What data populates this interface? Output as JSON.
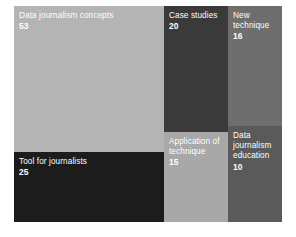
{
  "chart_data": {
    "type": "treemap",
    "title": "",
    "xlabel": "",
    "ylabel": "",
    "legend": "none",
    "grid": false,
    "categories": [
      "Data journalism concepts",
      "Tool for journalists",
      "Case studies",
      "Application of technique",
      "New technique",
      "Data journalism education"
    ],
    "values": [
      53,
      25,
      20,
      15,
      16,
      10
    ],
    "nodes": [
      {
        "label": "Data journalism concepts",
        "value": "53",
        "color": "#b4b4b4",
        "text_color": "#ffffff"
      },
      {
        "label": "Tool for journalists",
        "value": "25",
        "color": "#1c1c1c",
        "text_color": "#ffffff"
      },
      {
        "label": "Case studies",
        "value": "20",
        "color": "#3a3a3a",
        "text_color": "#ffffff"
      },
      {
        "label": "Application of\ntechnique",
        "value": "15",
        "color": "#a8a8a8",
        "text_color": "#ffffff"
      },
      {
        "label": "New\ntechnique",
        "value": "16",
        "color": "#6e6e6e",
        "text_color": "#ffffff"
      },
      {
        "label": "Data\njournalism\neducation",
        "value": "10",
        "color": "#5a5a5a",
        "text_color": "#ffffff"
      }
    ]
  }
}
